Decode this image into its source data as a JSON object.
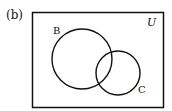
{
  "figure": {
    "panel_label": "(b)",
    "universe_label": "U",
    "sets": [
      {
        "name": "B",
        "label": "B"
      },
      {
        "name": "C",
        "label": "C"
      }
    ],
    "stroke_color": "#111111",
    "background": "#ffffff"
  }
}
